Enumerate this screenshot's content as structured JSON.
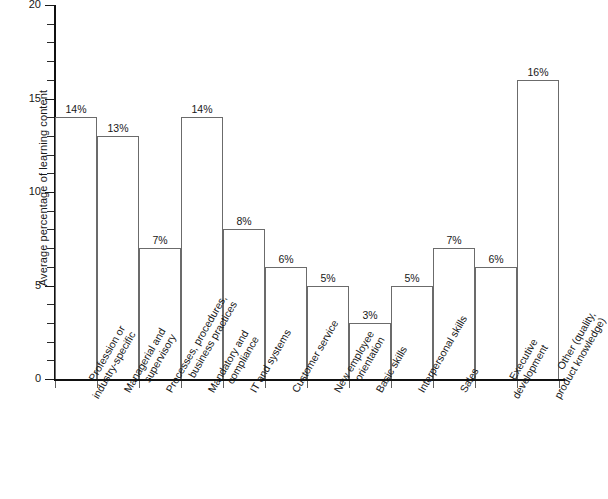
{
  "chart_data": {
    "type": "bar",
    "title": "",
    "subtitle": "",
    "xlabel": "",
    "ylabel": "Average percentage of learning content",
    "ylim": [
      0,
      20
    ],
    "y_ticks": [
      0,
      5,
      10,
      15,
      20
    ],
    "y_tick_labels": [
      "0",
      "5",
      "10",
      "15",
      "20"
    ],
    "y_minor_tick_step": 1,
    "grid": false,
    "legend": "none",
    "value_label_suffix": "%",
    "categories": [
      "Profession or industry-specific",
      "Managerial and supervisory",
      "Processes, procedures, business practices",
      "Mandatory and compliance",
      "IT and systems",
      "Customer service",
      "New employee orientation",
      "Basic skills",
      "Interpersonal skills",
      "Sales",
      "Executive development",
      "Other (quality, product knowledge)"
    ],
    "category_lines": [
      [
        "Profession or",
        "industry-specific"
      ],
      [
        "Managerial and",
        "supervisory"
      ],
      [
        "Processes, procedures,",
        "business practices"
      ],
      [
        "Mandatory and",
        "compliance"
      ],
      [
        "IT and systems"
      ],
      [
        "Customer service"
      ],
      [
        "New employee",
        "orientation"
      ],
      [
        "Basic skills"
      ],
      [
        "Interpersonal skills"
      ],
      [
        "Sales"
      ],
      [
        "Executive",
        "development"
      ],
      [
        "Other (quality,",
        "product knowledge)"
      ]
    ],
    "values": [
      14,
      13,
      7,
      14,
      8,
      6,
      5,
      3,
      5,
      7,
      6,
      16
    ],
    "value_labels": [
      "14%",
      "13%",
      "7%",
      "14%",
      "8%",
      "6%",
      "5%",
      "3%",
      "5%",
      "7%",
      "6%",
      "16%"
    ],
    "colors": {
      "bar_fill": "#ffffff",
      "bar_stroke": "#6b6b6b",
      "axis": "#111111",
      "text": "#171717",
      "background": "#ffffff"
    }
  }
}
